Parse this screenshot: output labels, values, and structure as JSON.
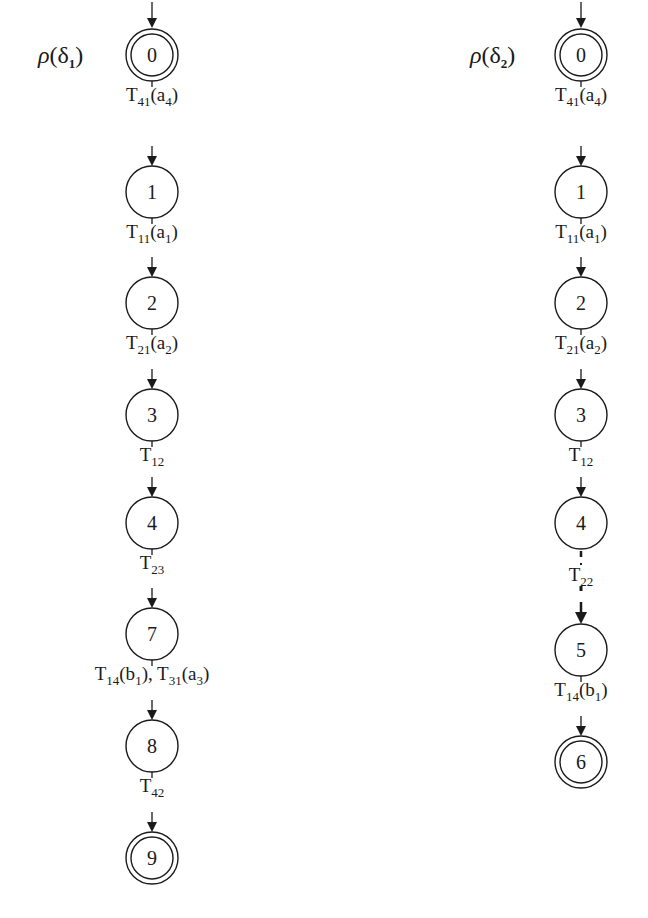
{
  "diagrams": [
    {
      "title_symbol": "ρ",
      "title_arg": "δ",
      "title_sub": "1",
      "cx": 152,
      "states": [
        {
          "id": "0",
          "cy": 55,
          "final": true,
          "initial": true
        },
        {
          "id": "1",
          "cy": 192,
          "final": false
        },
        {
          "id": "2",
          "cy": 303,
          "final": false
        },
        {
          "id": "3",
          "cy": 415,
          "final": false
        },
        {
          "id": "4",
          "cy": 523,
          "final": false
        },
        {
          "id": "7",
          "cy": 634,
          "final": false
        },
        {
          "id": "8",
          "cy": 746,
          "final": false
        },
        {
          "id": "9",
          "cy": 858,
          "final": true
        }
      ],
      "transitions": [
        {
          "from": "0",
          "to": "1",
          "label": [
            {
              "t": "T"
            },
            {
              "s": "41"
            },
            {
              "t": "(a"
            },
            {
              "s": "4"
            },
            {
              "t": ")"
            }
          ],
          "dotted": false
        },
        {
          "from": "1",
          "to": "2",
          "label": [
            {
              "t": "T"
            },
            {
              "s": "11"
            },
            {
              "t": "(a"
            },
            {
              "s": "1"
            },
            {
              "t": ")"
            }
          ],
          "dotted": false
        },
        {
          "from": "2",
          "to": "3",
          "label": [
            {
              "t": "T"
            },
            {
              "s": "21"
            },
            {
              "t": "(a"
            },
            {
              "s": "2"
            },
            {
              "t": ")"
            }
          ],
          "dotted": false
        },
        {
          "from": "3",
          "to": "4",
          "label": [
            {
              "t": "T"
            },
            {
              "s": "12"
            }
          ],
          "dotted": false
        },
        {
          "from": "4",
          "to": "7",
          "label": [
            {
              "t": "T"
            },
            {
              "s": "23"
            }
          ],
          "dotted": false
        },
        {
          "from": "7",
          "to": "8",
          "label": [
            {
              "t": "T"
            },
            {
              "s": "14"
            },
            {
              "t": "(b"
            },
            {
              "s": "1"
            },
            {
              "t": "), T"
            },
            {
              "s": "31"
            },
            {
              "t": "(a"
            },
            {
              "s": "3"
            },
            {
              "t": ")"
            }
          ],
          "dotted": false
        },
        {
          "from": "8",
          "to": "9",
          "label": [
            {
              "t": "T"
            },
            {
              "s": "42"
            }
          ],
          "dotted": false
        }
      ]
    },
    {
      "title_symbol": "ρ",
      "title_arg": "δ",
      "title_sub": "2",
      "cx": 581,
      "states": [
        {
          "id": "0",
          "cy": 55,
          "final": true,
          "initial": true
        },
        {
          "id": "1",
          "cy": 192,
          "final": false
        },
        {
          "id": "2",
          "cy": 303,
          "final": false
        },
        {
          "id": "3",
          "cy": 415,
          "final": false
        },
        {
          "id": "4",
          "cy": 523,
          "final": false
        },
        {
          "id": "5",
          "cy": 650,
          "final": false
        },
        {
          "id": "6",
          "cy": 762,
          "final": true
        }
      ],
      "transitions": [
        {
          "from": "0",
          "to": "1",
          "label": [
            {
              "t": "T"
            },
            {
              "s": "41"
            },
            {
              "t": "(a"
            },
            {
              "s": "4"
            },
            {
              "t": ")"
            }
          ],
          "dotted": false
        },
        {
          "from": "1",
          "to": "2",
          "label": [
            {
              "t": "T"
            },
            {
              "s": "11"
            },
            {
              "t": "(a"
            },
            {
              "s": "1"
            },
            {
              "t": ")"
            }
          ],
          "dotted": false
        },
        {
          "from": "2",
          "to": "3",
          "label": [
            {
              "t": "T"
            },
            {
              "s": "21"
            },
            {
              "t": "(a"
            },
            {
              "s": "2"
            },
            {
              "t": ")"
            }
          ],
          "dotted": false
        },
        {
          "from": "3",
          "to": "4",
          "label": [
            {
              "t": "T"
            },
            {
              "s": "12"
            }
          ],
          "dotted": false
        },
        {
          "from": "4",
          "to": "5",
          "label": [
            {
              "t": "T"
            },
            {
              "s": "22"
            }
          ],
          "dotted": true
        },
        {
          "from": "5",
          "to": "6",
          "label": [
            {
              "t": "T"
            },
            {
              "s": "14"
            },
            {
              "t": "(b"
            },
            {
              "s": "1"
            },
            {
              "t": ")"
            }
          ],
          "dotted": false
        }
      ]
    }
  ],
  "colors": {
    "stroke": "#1a1a1a",
    "background": "#ffffff"
  }
}
